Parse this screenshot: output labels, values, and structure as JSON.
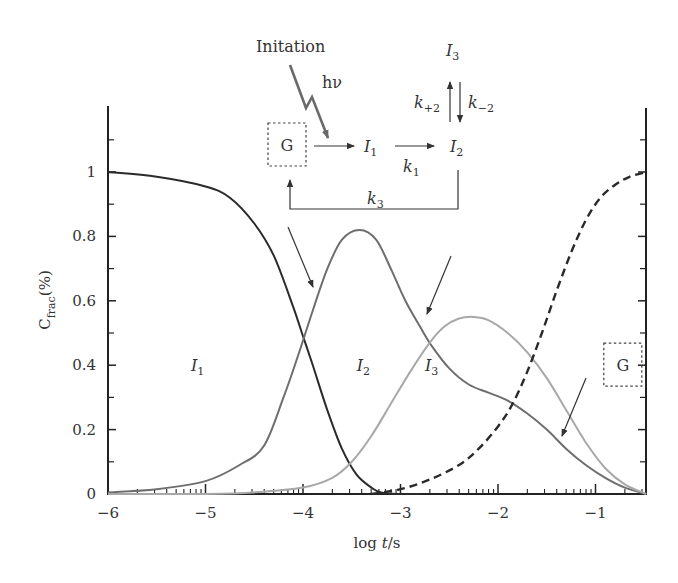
{
  "chart_data": {
    "type": "line",
    "title": "",
    "xlabel": "log t/s",
    "ylabel": "C_frac(%)",
    "xlim": [
      -6,
      -0.48
    ],
    "ylim": [
      0,
      1.2
    ],
    "grid": false,
    "x_ticks": [
      -6,
      -5,
      -4,
      -3,
      -2,
      -1
    ],
    "x_tick_labels": [
      "−6",
      "−5",
      "−4",
      "−3",
      "−2",
      "−1"
    ],
    "y_ticks": [
      0,
      0.2,
      0.4,
      0.6,
      0.8,
      1
    ],
    "y_tick_labels": [
      "0",
      "0.2",
      "0.4",
      "0.6",
      "0.8",
      "1"
    ],
    "y_minor_ticks": [
      0.1,
      0.3,
      0.5,
      0.7,
      0.9,
      1.1
    ],
    "series": [
      {
        "name": "I1",
        "style": "solid",
        "color": "#2a2a2a",
        "x": [
          -6.0,
          -5.5,
          -5.0,
          -4.75,
          -4.5,
          -4.3,
          -4.1,
          -4.0,
          -3.9,
          -3.75,
          -3.6,
          -3.45,
          -3.3,
          -3.2,
          -3.0,
          -2.8
        ],
        "y": [
          1.0,
          0.985,
          0.955,
          0.92,
          0.84,
          0.74,
          0.58,
          0.49,
          0.4,
          0.26,
          0.14,
          0.06,
          0.02,
          0.005,
          0.0,
          0.0
        ]
      },
      {
        "name": "I2",
        "style": "solid",
        "color": "#6e6e6e",
        "x": [
          -6.0,
          -5.5,
          -5.0,
          -4.65,
          -4.4,
          -4.2,
          -4.05,
          -3.9,
          -3.75,
          -3.6,
          -3.42,
          -3.25,
          -3.1,
          -2.95,
          -2.8,
          -2.68,
          -2.5,
          -2.3,
          -2.1,
          -1.9,
          -1.7,
          -1.5,
          -1.3,
          -1.1,
          -0.9,
          -0.7,
          -0.48
        ],
        "y": [
          0.005,
          0.015,
          0.04,
          0.09,
          0.15,
          0.3,
          0.43,
          0.57,
          0.7,
          0.79,
          0.82,
          0.79,
          0.7,
          0.6,
          0.52,
          0.46,
          0.39,
          0.34,
          0.315,
          0.29,
          0.25,
          0.2,
          0.14,
          0.09,
          0.05,
          0.02,
          0.0
        ]
      },
      {
        "name": "I3",
        "style": "solid",
        "color": "#a8a8a8",
        "x": [
          -6.0,
          -5.0,
          -4.5,
          -4.0,
          -3.7,
          -3.5,
          -3.3,
          -3.1,
          -2.9,
          -2.7,
          -2.55,
          -2.4,
          -2.25,
          -2.1,
          -1.9,
          -1.7,
          -1.5,
          -1.3,
          -1.1,
          -0.9,
          -0.7,
          -0.48
        ],
        "y": [
          0.0,
          0.0,
          0.005,
          0.02,
          0.05,
          0.1,
          0.18,
          0.28,
          0.38,
          0.47,
          0.52,
          0.545,
          0.55,
          0.54,
          0.5,
          0.44,
          0.36,
          0.26,
          0.16,
          0.08,
          0.03,
          0.0
        ]
      },
      {
        "name": "G",
        "style": "dashed",
        "color": "#2a2a2a",
        "x": [
          -3.3,
          -3.0,
          -2.7,
          -2.4,
          -2.2,
          -2.0,
          -1.85,
          -1.7,
          -1.55,
          -1.4,
          -1.25,
          -1.1,
          -0.95,
          -0.8,
          -0.65,
          -0.48
        ],
        "y": [
          0.0,
          0.015,
          0.045,
          0.09,
          0.14,
          0.21,
          0.28,
          0.38,
          0.5,
          0.63,
          0.75,
          0.85,
          0.92,
          0.96,
          0.985,
          1.0
        ]
      }
    ],
    "annotations": {
      "curve_labels": [
        {
          "text": "I",
          "sub": "1",
          "x": -5.15,
          "y": 0.4
        },
        {
          "text": "I",
          "sub": "2",
          "x": -3.45,
          "y": 0.4
        },
        {
          "text": "I",
          "sub": "3",
          "x": -2.75,
          "y": 0.4
        },
        {
          "text": "G",
          "sub": "",
          "x": -0.72,
          "y": 0.4,
          "boxed": true
        }
      ],
      "scheme": {
        "initiation_label": "Initation",
        "light_label": "hν",
        "species_g": "G",
        "species_i1": "I",
        "species_i1_sub": "1",
        "species_i2": "I",
        "species_i2_sub": "2",
        "species_i3": "I",
        "species_i3_sub": "3",
        "k1": "k",
        "k1_sub": "1",
        "k_plus2": "k",
        "k_plus2_sub": "+2",
        "k_minus2": "k",
        "k_minus2_sub": "−2",
        "k3": "k",
        "k3_sub": "3"
      },
      "pointer_arrows": 3
    }
  }
}
